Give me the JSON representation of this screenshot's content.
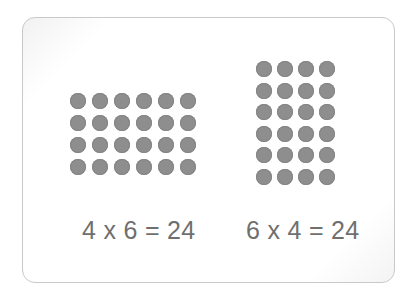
{
  "figure": {
    "left_array": {
      "rows": 4,
      "columns": 6,
      "equation": "4 x 6 = 24"
    },
    "right_array": {
      "rows": 6,
      "columns": 4,
      "equation": "6 x 4 = 24"
    },
    "colors": {
      "dot": "#8e8e8e",
      "text": "#6f6f6f",
      "border": "#c9c9c9",
      "background": "#ffffff"
    }
  }
}
